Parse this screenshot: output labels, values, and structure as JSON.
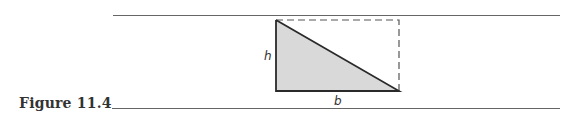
{
  "figure": {
    "caption": "Figure 11.4",
    "labels": {
      "height": "h",
      "base": "b"
    },
    "colors": {
      "line": "#555555",
      "fill": "#d9d9d9",
      "stroke": "#2a2a2a"
    }
  }
}
